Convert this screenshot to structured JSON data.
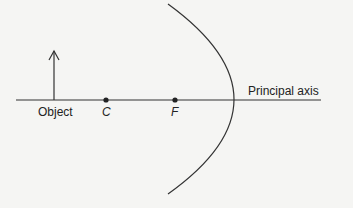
{
  "diagram": {
    "labels": {
      "object": "Object",
      "center": "C",
      "focus": "F",
      "axis": "Principal axis"
    },
    "colors": {
      "line": "#333333",
      "background": "#f5f5f3"
    }
  }
}
